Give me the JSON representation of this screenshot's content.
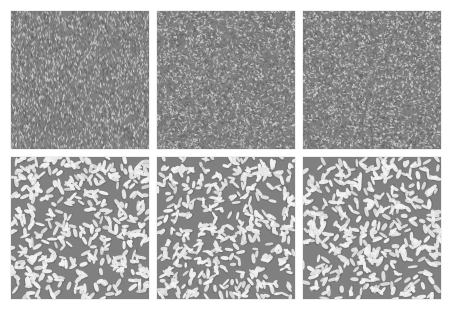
{
  "figure": {
    "background_color": "#ffffff",
    "width": 452,
    "height": 320,
    "rows": 2,
    "columns": 3,
    "panel_gap_px": 8,
    "margin_px": 11
  },
  "palette": {
    "background": "#ffffff",
    "texture_base_gray": "#808080",
    "element_light": "#e8e8e8",
    "element_white": "#f2f2f2",
    "element_dark": "#5e5e5e",
    "element_shadow": "#6a6a6a"
  },
  "panels": [
    {
      "id": "panel-top-left",
      "row": 1,
      "column": 1,
      "kind": "fine-grain-texture",
      "label": "",
      "base_color": "#808080",
      "element_density": "very-high",
      "element_length_px": 3.2,
      "element_width_px": 1.1,
      "orientation": "near-vertical-jitter",
      "orientation_mean_deg": 88,
      "orientation_spread_deg": 26,
      "element_count": 4200,
      "seed": 101
    },
    {
      "id": "panel-top-center",
      "row": 1,
      "column": 2,
      "kind": "fine-grain-texture",
      "label": "",
      "base_color": "#808080",
      "element_density": "very-high",
      "element_length_px": 3.0,
      "element_width_px": 1.1,
      "orientation": "isotropic-random",
      "orientation_mean_deg": 45,
      "orientation_spread_deg": 90,
      "element_count": 4400,
      "seed": 202
    },
    {
      "id": "panel-top-right",
      "row": 1,
      "column": 3,
      "kind": "fine-grain-texture",
      "label": "",
      "base_color": "#808080",
      "element_density": "very-high",
      "element_length_px": 2.8,
      "element_width_px": 1.2,
      "orientation": "isotropic-random",
      "orientation_mean_deg": 0,
      "orientation_spread_deg": 90,
      "element_count": 4600,
      "seed": 303
    },
    {
      "id": "panel-bottom-left",
      "row": 2,
      "column": 1,
      "kind": "coarse-blob-texture",
      "label": "",
      "base_color": "#808080",
      "element_density": "medium",
      "element_length_px": 8.5,
      "element_width_px": 3.4,
      "orientation": "isotropic-random",
      "orientation_mean_deg": 0,
      "orientation_spread_deg": 90,
      "element_count": 430,
      "seed": 404
    },
    {
      "id": "panel-bottom-center",
      "row": 2,
      "column": 2,
      "kind": "coarse-blob-texture",
      "label": "",
      "base_color": "#808080",
      "element_density": "medium",
      "element_length_px": 8.0,
      "element_width_px": 3.2,
      "orientation": "isotropic-random",
      "orientation_mean_deg": 0,
      "orientation_spread_deg": 90,
      "element_count": 445,
      "seed": 505
    },
    {
      "id": "panel-bottom-right",
      "row": 2,
      "column": 3,
      "kind": "coarse-blob-texture",
      "label": "",
      "base_color": "#808080",
      "element_density": "medium",
      "element_length_px": 8.8,
      "element_width_px": 3.5,
      "orientation": "isotropic-random",
      "orientation_mean_deg": 0,
      "orientation_spread_deg": 90,
      "element_count": 420,
      "seed": 606
    }
  ]
}
